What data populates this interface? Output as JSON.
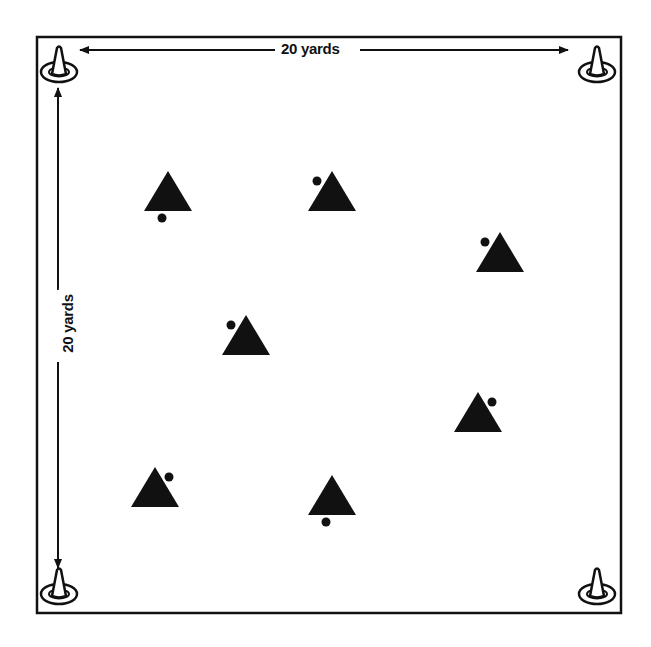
{
  "diagram": {
    "field": {
      "x": 37,
      "y": 37,
      "width": 584,
      "height": 576,
      "border_color": "#111111"
    },
    "dimensions": {
      "top_label": "20 yards",
      "left_label": "20 yards"
    },
    "cones": [
      {
        "id": "top-left",
        "x": 59,
        "y": 68
      },
      {
        "id": "top-right",
        "x": 597,
        "y": 68
      },
      {
        "id": "bottom-left",
        "x": 59,
        "y": 590
      },
      {
        "id": "bottom-right",
        "x": 597,
        "y": 590
      }
    ],
    "players": [
      {
        "id": 1,
        "x": 168,
        "y": 192,
        "ball": "below"
      },
      {
        "id": 2,
        "x": 332,
        "y": 192,
        "ball": "upper-left"
      },
      {
        "id": 3,
        "x": 500,
        "y": 253,
        "ball": "upper-left"
      },
      {
        "id": 4,
        "x": 246,
        "y": 336,
        "ball": "upper-left"
      },
      {
        "id": 5,
        "x": 478,
        "y": 413,
        "ball": "upper-right"
      },
      {
        "id": 6,
        "x": 155,
        "y": 488,
        "ball": "upper-right"
      },
      {
        "id": 7,
        "x": 332,
        "y": 496,
        "ball": "below"
      }
    ],
    "colors": {
      "ink": "#111111",
      "background": "#ffffff"
    }
  }
}
